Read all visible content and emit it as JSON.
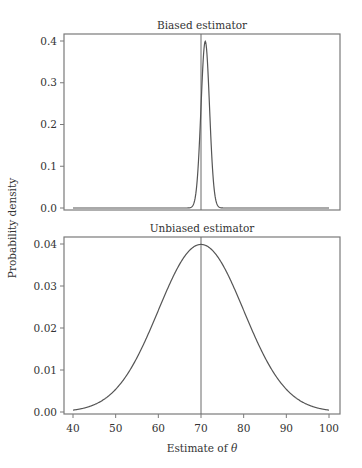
{
  "chart_data": [
    {
      "type": "line",
      "title": "Biased estimator",
      "xlabel": "",
      "ylabel": "Probability density",
      "xlim": [
        40,
        100
      ],
      "ylim": [
        0.0,
        0.4
      ],
      "yticks": [
        0.0,
        0.1,
        0.2,
        0.3,
        0.4
      ],
      "ytick_labels": [
        "0.0",
        "0.1",
        "0.2",
        "0.3",
        "0.4"
      ],
      "xticks_shown": false,
      "grid": false,
      "series": [
        {
          "name": "Sampling distribution",
          "distribution": "normal",
          "mean": 71,
          "sd": 1,
          "x": [
            40,
            66,
            68,
            69,
            70,
            70.5,
            71,
            71.5,
            72,
            73,
            74,
            76,
            100
          ],
          "y": [
            0.0,
            1.5e-06,
            0.0044,
            0.054,
            0.242,
            0.352,
            0.399,
            0.352,
            0.242,
            0.054,
            0.0044,
            1.5e-06,
            0.0
          ]
        }
      ],
      "vline": {
        "x": 70,
        "label": "true value of theta"
      }
    },
    {
      "type": "line",
      "title": "Unbiased estimator",
      "xlabel": "Estimate of θ",
      "ylabel": "Probability density",
      "xlim": [
        40,
        100
      ],
      "ylim": [
        0.0,
        0.04
      ],
      "xticks": [
        40,
        50,
        60,
        70,
        80,
        90,
        100
      ],
      "xtick_labels": [
        "40",
        "50",
        "60",
        "70",
        "80",
        "90",
        "100"
      ],
      "yticks": [
        0.0,
        0.01,
        0.02,
        0.03,
        0.04
      ],
      "ytick_labels": [
        "0.00",
        "0.01",
        "0.02",
        "0.03",
        "0.04"
      ],
      "grid": false,
      "series": [
        {
          "name": "Sampling distribution",
          "distribution": "normal",
          "mean": 70,
          "sd": 10,
          "x": [
            40,
            45,
            50,
            55,
            60,
            65,
            70,
            75,
            80,
            85,
            90,
            95,
            100
          ],
          "y": [
            0.0004,
            0.0018,
            0.0054,
            0.013,
            0.0242,
            0.0352,
            0.0399,
            0.0352,
            0.0242,
            0.013,
            0.0054,
            0.0018,
            0.0004
          ]
        }
      ],
      "vline": {
        "x": 70,
        "label": "true value of theta"
      }
    }
  ],
  "figure": {
    "shared_ylabel": "Probability density",
    "shared_xlabel": "Estimate of θ",
    "colors": {
      "frame": "#7a7a7a",
      "curve": "#555555",
      "vline": "#6a6a6a",
      "text": "#333333"
    }
  }
}
